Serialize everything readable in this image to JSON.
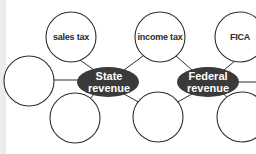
{
  "diagram": {
    "hubs": [
      {
        "id": "state",
        "line1": "State",
        "line2": "revenue"
      },
      {
        "id": "federal",
        "line1": "Federal",
        "line2": "revenue"
      }
    ],
    "nodes": [
      {
        "id": "sales-tax",
        "label": "sales tax",
        "hub": "state"
      },
      {
        "id": "state-left",
        "label": "",
        "hub": "state"
      },
      {
        "id": "state-bottom",
        "label": "",
        "hub": "state"
      },
      {
        "id": "income-tax",
        "label": "income tax",
        "hub": "shared"
      },
      {
        "id": "shared-bottom",
        "label": "",
        "hub": "shared"
      },
      {
        "id": "fica",
        "label": "FICA",
        "hub": "federal"
      },
      {
        "id": "federal-bottom",
        "label": "",
        "hub": "federal"
      }
    ],
    "colors": {
      "hub_fill": "#3a3a3a",
      "hub_text": "#ffffff",
      "stroke": "#2e2e2e",
      "node_fill": "#ffffff"
    }
  }
}
